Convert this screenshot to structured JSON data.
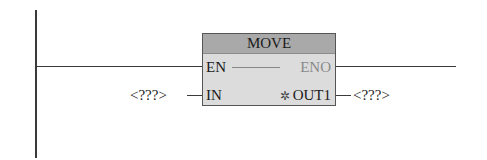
{
  "block": {
    "title": "MOVE",
    "inputs": [
      {
        "name": "EN"
      },
      {
        "name": "IN"
      }
    ],
    "outputs": [
      {
        "name": "ENO"
      },
      {
        "name": "OUT1",
        "symbol": "✲"
      }
    ]
  },
  "operands": {
    "in": "<???>",
    "out": "<???>"
  }
}
